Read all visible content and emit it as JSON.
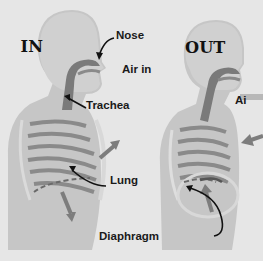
{
  "panels": [
    {
      "title": "IN"
    },
    {
      "title": "OUT"
    }
  ],
  "labels": {
    "nose": "Nose",
    "air_in": "Air in",
    "trachea": "Trachea",
    "lung": "Lung",
    "diaphragm": "Diaphragm",
    "air_out_partial": "Ai"
  },
  "colors": {
    "background": "#e6e6e6",
    "body": "#c4c4c4",
    "body_light": "#d4d4d4",
    "airway": "#7a7a7a",
    "ribs": "#8c8c8c",
    "arrow": "#7d7d7d",
    "text": "#1a1a1a"
  }
}
